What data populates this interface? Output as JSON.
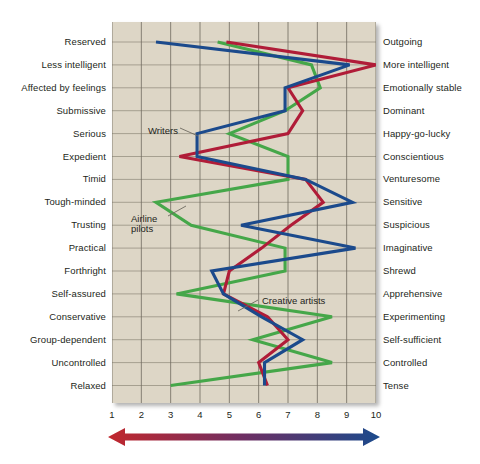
{
  "figure": {
    "background_color": "#ffffff",
    "plot_background_color": "#ddd6c6",
    "grid_color": "#8e8878"
  },
  "axis": {
    "ticks": [
      "1",
      "2",
      "3",
      "4",
      "5",
      "6",
      "7",
      "8",
      "9",
      "10"
    ],
    "min": 1,
    "max": 10
  },
  "arrow": {
    "left_color": "#c1272d",
    "right_color": "#1b4a8c",
    "name": "bipolar-gradient-arrow"
  },
  "annotations": [
    {
      "text": "Writers",
      "x": 148,
      "y": 126,
      "leader": {
        "x1": 180,
        "y1": 128,
        "x2": 198,
        "y2": 136
      }
    },
    {
      "text": "Airline\npilots",
      "x": 131,
      "y": 214,
      "leader": {
        "x1": 168,
        "y1": 216,
        "x2": 186,
        "y2": 206
      }
    },
    {
      "text": "Creative artists",
      "x": 262,
      "y": 296,
      "leader": {
        "x1": 258,
        "y1": 300,
        "x2": 238,
        "y2": 311
      }
    }
  ],
  "chart_data": {
    "type": "line",
    "title": "",
    "orientation": "horizontal",
    "xlabel": "",
    "ylabel": "",
    "xlim": [
      1,
      10
    ],
    "grid": true,
    "legend": "inline-annotations",
    "categories_left": [
      "Reserved",
      "Less intelligent",
      "Affected by feelings",
      "Submissive",
      "Serious",
      "Expedient",
      "Timid",
      "Tough-minded",
      "Trusting",
      "Practical",
      "Forthright",
      "Self-assured",
      "Conservative",
      "Group-dependent",
      "Uncontrolled",
      "Relaxed"
    ],
    "categories_right": [
      "Outgoing",
      "More intelligent",
      "Emotionally stable",
      "Dominant",
      "Happy-go-lucky",
      "Conscientious",
      "Venturesome",
      "Sensitive",
      "Suspicious",
      "Imaginative",
      "Shrewd",
      "Apprehensive",
      "Experimenting",
      "Self-sufficient",
      "Controlled",
      "Tense"
    ],
    "series": [
      {
        "name": "Writers",
        "color": "#1b4a8c",
        "values": [
          2.5,
          9.1,
          6.9,
          6.9,
          3.9,
          3.9,
          7.6,
          9.2,
          5.4,
          9.3,
          4.4,
          4.8,
          6.1,
          7.5,
          6.2,
          6.2
        ]
      },
      {
        "name": "Creative artists",
        "color": "#b01c38",
        "values": [
          4.9,
          10.0,
          7.0,
          7.5,
          7.0,
          3.3,
          7.6,
          8.2,
          7.1,
          6.1,
          5.0,
          4.8,
          6.3,
          7.0,
          6.0,
          6.3
        ]
      },
      {
        "name": "Airline pilots",
        "color": "#45a749",
        "values": [
          4.6,
          7.8,
          8.1,
          6.9,
          5.0,
          7.0,
          7.0,
          2.5,
          3.7,
          6.9,
          6.9,
          3.2,
          8.5,
          5.8,
          8.5,
          3.0
        ]
      }
    ]
  }
}
